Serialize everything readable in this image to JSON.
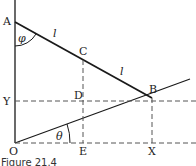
{
  "figure": {
    "caption": "Figure 21.4",
    "points": {
      "A": {
        "label": "A",
        "x": 15,
        "y": 22
      },
      "C": {
        "label": "C",
        "x": 83,
        "y": 57
      },
      "B": {
        "label": "B",
        "x": 152,
        "y": 98
      },
      "Y": {
        "label": "Y",
        "x": 15,
        "y": 101
      },
      "D": {
        "label": "D",
        "x": 83,
        "y": 101
      },
      "O": {
        "label": "O",
        "x": 15,
        "y": 143
      },
      "E": {
        "label": "E",
        "x": 83,
        "y": 143
      },
      "X": {
        "label": "X",
        "x": 152,
        "y": 143
      }
    },
    "segment_labels": {
      "AC": "l",
      "CB": "l"
    },
    "angles": {
      "phi": "φ",
      "theta": "θ"
    },
    "colors": {
      "stroke": "#1a1a1a",
      "dashed": "#555555",
      "background": "#ffffff"
    }
  }
}
